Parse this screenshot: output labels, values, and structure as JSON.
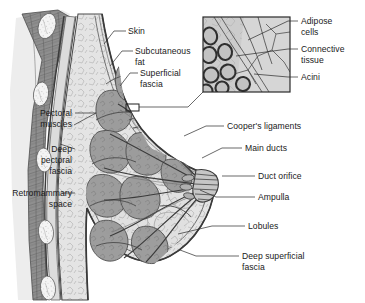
{
  "figure": {
    "background_color": "#ffffff"
  },
  "palette": {
    "skin_line": "#4a4a4a",
    "fat_fill": "#e2e2e2",
    "lobule_fill": "#9a9a9a",
    "lobule_stroke": "#4f4f4f",
    "muscle_fill": "#8d8d8d",
    "muscle_stroke": "#4a4a4a",
    "rib_fill": "#f2f2f2",
    "fascia_fill": "#c9c9c9",
    "duct_stroke": "#3c3c3c",
    "inset_fill": "#cfcfcf",
    "acini_fill": "#bdbdbd",
    "acini_stroke": "#3a3a3a",
    "text_color": "#1a1a1a",
    "leader_color": "#2a2a2a"
  },
  "labels_left": [
    {
      "id": "pectoral-muscles",
      "text_lines": [
        "Pectoral",
        "muscles"
      ],
      "x": 72,
      "y": 116,
      "line_height": 11
    },
    {
      "id": "deep-pectoral-fascia",
      "text_lines": [
        "Deep",
        "pectoral",
        "fascia"
      ],
      "x": 72,
      "y": 152,
      "line_height": 11
    },
    {
      "id": "retromammary-space",
      "text_lines": [
        "Retromammary",
        "space"
      ],
      "x": 72,
      "y": 196,
      "line_height": 11
    }
  ],
  "labels_top": [
    {
      "id": "skin",
      "text_lines": [
        "Skin"
      ],
      "x": 128,
      "y": 34,
      "line_height": 11
    },
    {
      "id": "subcutaneous-fat",
      "text_lines": [
        "Subcutaneous",
        "fat"
      ],
      "x": 135,
      "y": 54,
      "line_height": 11
    },
    {
      "id": "superficial-fascia",
      "text_lines": [
        "Superficial",
        "fascia"
      ],
      "x": 140,
      "y": 76,
      "line_height": 11
    }
  ],
  "labels_inset": [
    {
      "id": "adipose-cells",
      "text_lines": [
        "Adipose",
        "cells"
      ],
      "x": 301,
      "y": 24,
      "line_height": 11
    },
    {
      "id": "connective-tissue",
      "text_lines": [
        "Connective",
        "tissue"
      ],
      "x": 301,
      "y": 52,
      "line_height": 11
    },
    {
      "id": "acini",
      "text_lines": [
        "Acini"
      ],
      "x": 301,
      "y": 80,
      "line_height": 11
    }
  ],
  "labels_right": [
    {
      "id": "coopers-ligaments",
      "text_lines": [
        "Cooper's ligaments"
      ],
      "x": 227,
      "y": 129,
      "line_height": 11
    },
    {
      "id": "main-ducts",
      "text_lines": [
        "Main ducts"
      ],
      "x": 245,
      "y": 151,
      "line_height": 11
    },
    {
      "id": "duct-orifice",
      "text_lines": [
        "Duct orifice"
      ],
      "x": 258,
      "y": 179,
      "line_height": 11
    },
    {
      "id": "ampulla",
      "text_lines": [
        "Ampulla"
      ],
      "x": 258,
      "y": 200,
      "line_height": 11
    },
    {
      "id": "lobules",
      "text_lines": [
        "Lobules"
      ],
      "x": 248,
      "y": 229,
      "line_height": 11
    },
    {
      "id": "deep-superficial-fascia",
      "text_lines": [
        "Deep superficial",
        "fascia"
      ],
      "x": 242,
      "y": 259,
      "line_height": 11
    }
  ],
  "inset": {
    "id": "magnified-inset",
    "x": 203,
    "y": 17,
    "width": 87,
    "height": 75,
    "source_marker": {
      "x": 126,
      "y": 104,
      "width": 13,
      "height": 7
    }
  }
}
